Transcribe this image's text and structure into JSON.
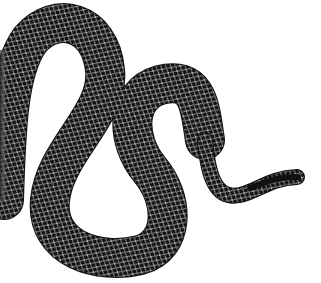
{
  "image": {
    "subject": "Black snake with white net-like scale pattern, S-curved body on white background",
    "colors": {
      "background": "#ffffff",
      "body": "#111111",
      "scale_lines": "#d9d9d9"
    }
  }
}
